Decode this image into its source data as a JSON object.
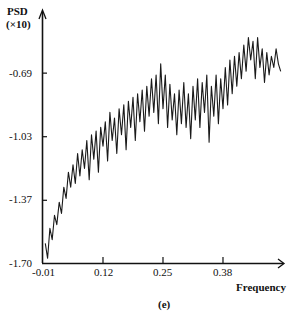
{
  "chart_data": {
    "type": "line",
    "title": "",
    "panel_label": "(e)",
    "xlabel": "Frequency",
    "ylabel": "PSD",
    "ylabel_scale": "(×10)",
    "xlim": [
      -0.01,
      0.51
    ],
    "ylim": [
      -1.7,
      -0.5
    ],
    "x_ticks": [
      "-0.01",
      "0.12",
      "0.25",
      "0.38"
    ],
    "y_ticks": [
      "-0.69",
      "-1.03",
      "-1.37",
      "-1.70"
    ],
    "grid": false,
    "legend": null,
    "series": [
      {
        "name": "PSD",
        "color": "#1a1a1a",
        "x": [
          -0.005,
          0.0,
          0.005,
          0.01,
          0.015,
          0.02,
          0.025,
          0.03,
          0.035,
          0.04,
          0.045,
          0.05,
          0.055,
          0.06,
          0.065,
          0.07,
          0.075,
          0.08,
          0.085,
          0.09,
          0.095,
          0.1,
          0.105,
          0.11,
          0.115,
          0.12,
          0.125,
          0.13,
          0.135,
          0.14,
          0.145,
          0.15,
          0.155,
          0.16,
          0.165,
          0.17,
          0.175,
          0.18,
          0.185,
          0.19,
          0.195,
          0.2,
          0.205,
          0.21,
          0.215,
          0.22,
          0.225,
          0.23,
          0.235,
          0.24,
          0.245,
          0.25,
          0.255,
          0.26,
          0.265,
          0.27,
          0.275,
          0.28,
          0.285,
          0.29,
          0.295,
          0.3,
          0.305,
          0.31,
          0.315,
          0.32,
          0.325,
          0.33,
          0.335,
          0.34,
          0.345,
          0.35,
          0.355,
          0.36,
          0.365,
          0.37,
          0.375,
          0.38,
          0.385,
          0.39,
          0.395,
          0.4,
          0.405,
          0.41,
          0.415,
          0.42,
          0.425,
          0.43,
          0.435,
          0.44,
          0.445,
          0.45,
          0.455,
          0.46,
          0.465,
          0.47,
          0.475,
          0.48,
          0.485,
          0.49,
          0.495,
          0.5,
          0.505
        ],
        "y": [
          -1.6,
          -1.68,
          -1.52,
          -1.58,
          -1.45,
          -1.5,
          -1.38,
          -1.44,
          -1.3,
          -1.36,
          -1.22,
          -1.3,
          -1.18,
          -1.28,
          -1.12,
          -1.24,
          -1.1,
          -1.2,
          -1.05,
          -1.26,
          -1.02,
          -1.15,
          -1.0,
          -1.22,
          -0.98,
          -1.08,
          -0.95,
          -1.16,
          -0.9,
          -1.05,
          -0.93,
          -1.12,
          -0.88,
          -1.02,
          -0.86,
          -1.1,
          -0.84,
          -0.98,
          -0.82,
          -1.05,
          -0.8,
          -0.95,
          -0.78,
          -1.0,
          -0.76,
          -0.92,
          -0.72,
          -0.9,
          -0.7,
          -0.96,
          -0.64,
          -0.88,
          -0.7,
          -0.98,
          -0.75,
          -0.94,
          -0.8,
          -1.02,
          -0.78,
          -0.96,
          -0.74,
          -0.98,
          -0.8,
          -1.04,
          -0.76,
          -0.94,
          -0.72,
          -0.98,
          -0.74,
          -0.9,
          -0.7,
          -1.06,
          -0.76,
          -0.92,
          -0.7,
          -0.96,
          -0.72,
          -0.88,
          -0.66,
          -0.86,
          -0.62,
          -0.8,
          -0.6,
          -0.76,
          -0.58,
          -0.72,
          -0.54,
          -0.68,
          -0.5,
          -0.62,
          -0.52,
          -0.72,
          -0.5,
          -0.66,
          -0.56,
          -0.74,
          -0.58,
          -0.7,
          -0.6,
          -0.66,
          -0.56,
          -0.64,
          -0.68
        ]
      }
    ]
  }
}
